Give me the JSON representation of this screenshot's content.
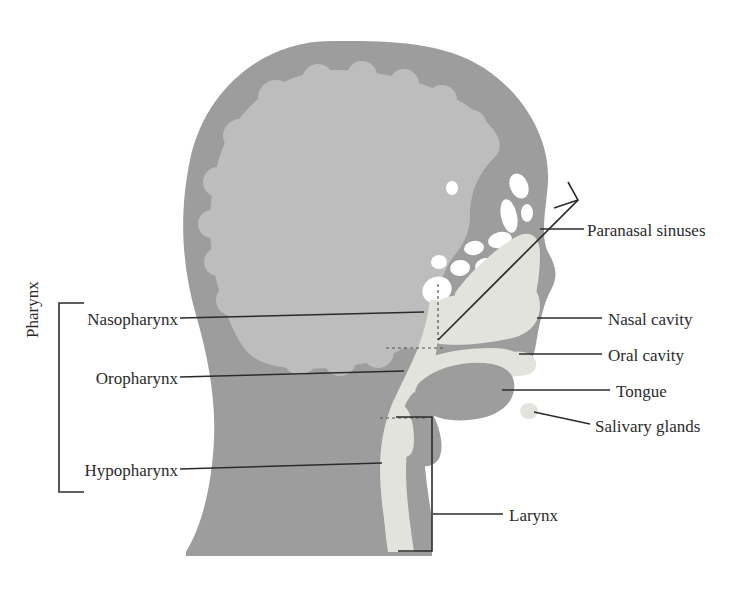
{
  "figure": {
    "background_color": "#ffffff",
    "width": 750,
    "height": 596
  },
  "palette": {
    "soft_tissue": "#9d9d9d",
    "brain": "#bdbdbd",
    "airway": "#e3e3de",
    "tongue": "#9d9d9d",
    "sinus_air": "#ffffff",
    "line": "#2b2b2b",
    "text": "#2b2b2b"
  },
  "group_labels": [
    {
      "id": "pharynx",
      "label": "Pharynx",
      "orientation": "vertical",
      "bracket": "left-square-bracket"
    }
  ],
  "labels": [
    {
      "id": "nasopharynx",
      "label": "Nasopharynx",
      "side": "left",
      "text_x": 170,
      "text_y": 321,
      "leader_from": [
        178,
        321
      ],
      "leader_to": [
        424,
        314
      ]
    },
    {
      "id": "oropharynx",
      "label": "Oropharynx",
      "side": "left",
      "text_x": 170,
      "text_y": 380,
      "leader_from": [
        178,
        380
      ],
      "leader_to": [
        404,
        374
      ]
    },
    {
      "id": "hypopharynx",
      "label": "Hypopharynx",
      "side": "left",
      "text_x": 170,
      "text_y": 472,
      "leader_from": [
        178,
        472
      ],
      "leader_to": [
        382,
        465
      ]
    },
    {
      "id": "paranasal-sinuses",
      "label": "Paranasal sinuses",
      "side": "right",
      "text_x": 586,
      "text_y": 233,
      "leader_from": [
        584,
        233
      ],
      "leader_to": [
        539,
        233
      ]
    },
    {
      "id": "nasal-cavity",
      "label": "Nasal cavity",
      "side": "right",
      "text_x": 607,
      "text_y": 322,
      "leader_from": [
        601,
        322
      ],
      "leader_to": [
        538,
        322
      ]
    },
    {
      "id": "oral-cavity",
      "label": "Oral cavity",
      "side": "right",
      "text_x": 607,
      "text_y": 357,
      "leader_from": [
        601,
        357
      ],
      "leader_to": [
        518,
        357
      ]
    },
    {
      "id": "tongue",
      "label": "Tongue",
      "side": "right",
      "text_x": 615,
      "text_y": 393,
      "leader_from": [
        609,
        393
      ],
      "leader_to": [
        503,
        393
      ]
    },
    {
      "id": "salivary-glands",
      "label": "Salivary glands",
      "side": "right",
      "text_x": 594,
      "text_y": 430,
      "leader_from": [
        590,
        427
      ],
      "leader_to": [
        533,
        413
      ]
    },
    {
      "id": "larynx",
      "label": "Larynx",
      "side": "right",
      "text_x": 508,
      "text_y": 517,
      "leader_from": [
        503,
        517
      ],
      "leader_to": [
        432,
        517
      ]
    }
  ],
  "regions": [
    {
      "id": "scalp-skull",
      "name": "scalp and skull",
      "tone": "soft_tissue"
    },
    {
      "id": "brain",
      "name": "brain",
      "tone": "brain"
    },
    {
      "id": "nasal-airway",
      "name": "nasal cavity airspace",
      "tone": "airway"
    },
    {
      "id": "oral-airway",
      "name": "oral cavity airspace",
      "tone": "airway"
    },
    {
      "id": "pharyngeal-airway",
      "name": "pharyngeal airway",
      "tone": "airway"
    },
    {
      "id": "tongue-body",
      "name": "tongue",
      "tone": "tongue"
    },
    {
      "id": "sinus-cells",
      "name": "paranasal sinus air cells",
      "tone": "sinus_air"
    },
    {
      "id": "salivary-gland-blob",
      "name": "salivary gland",
      "tone": "sinus_air"
    },
    {
      "id": "epiglottis",
      "name": "epiglottis",
      "tone": "sinus_air"
    }
  ]
}
